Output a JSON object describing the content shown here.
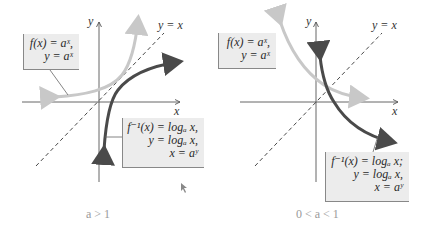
{
  "left_panel": {
    "caption": "a > 1",
    "axis_x": "x",
    "axis_y": "y",
    "identity_label": "y = x",
    "exp_label": {
      "line1": "f(x) = aˣ,",
      "line2": "y = aˣ"
    },
    "log_label": {
      "line1": "f⁻¹(x) = logₐ x,",
      "line2": "y = logₐ x,",
      "line3": "x = aʸ"
    }
  },
  "right_panel": {
    "caption": "0 < a < 1",
    "axis_x": "x",
    "axis_y": "y",
    "identity_label": "y = x",
    "exp_label": {
      "line1": "f(x) = aˣ,",
      "line2": "y = aˣ"
    },
    "log_label": {
      "line1": "f⁻¹(x) = logₐ x;",
      "line2": "y = logₐ x,",
      "line3": "x = aʸ"
    }
  },
  "colors": {
    "exp_curve": "#c8c8c8",
    "log_curve": "#4a4a4a",
    "axes": "#555555",
    "label_bg": "#ececec"
  }
}
